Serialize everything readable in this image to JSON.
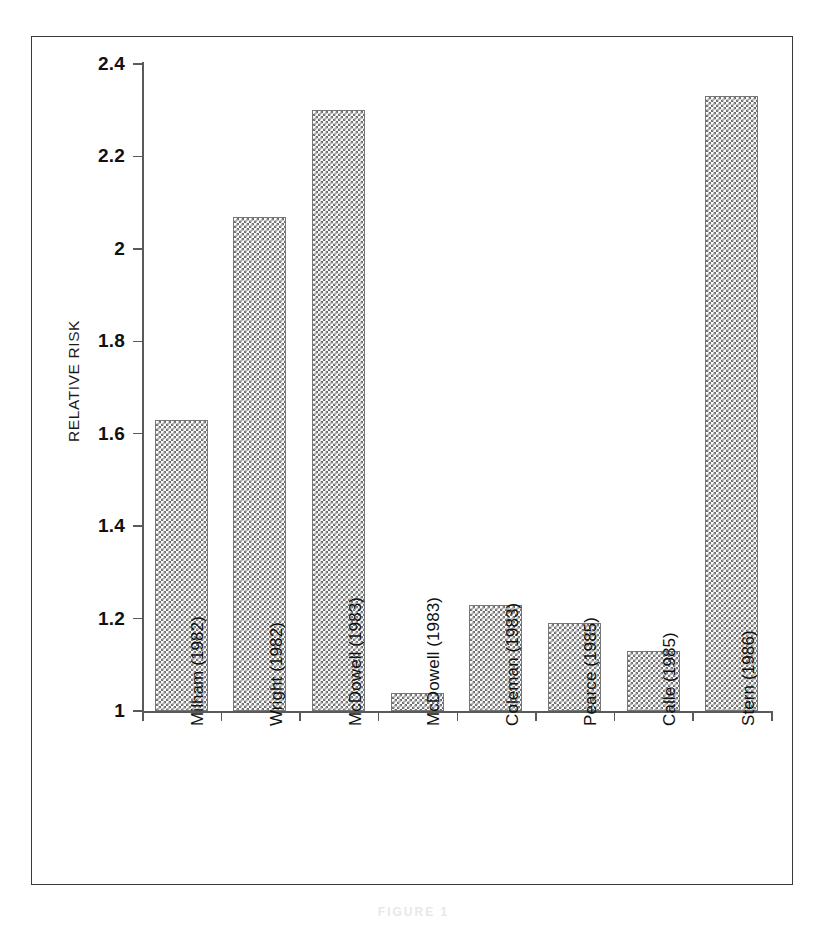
{
  "figure": {
    "caption": "FIGURE 1"
  },
  "chart_data": {
    "type": "bar",
    "title": "",
    "xlabel": "",
    "ylabel": "RELATIVE RISK",
    "ylim": [
      1,
      2.4
    ],
    "yticks": [
      "1",
      "1.2",
      "1.4",
      "1.6",
      "1.8",
      "2",
      "2.2",
      "2.4"
    ],
    "ytick_values": [
      1,
      1.2,
      1.4,
      1.6,
      1.8,
      2,
      2.2,
      2.4
    ],
    "grid": false,
    "legend": null,
    "categories": [
      "Milham (1982)",
      "Wright (1982)",
      "McDowell (1983)",
      "McDowell (1983)",
      "Coleman (1983)",
      "Pearce (1985)",
      "Calle (1985)",
      "Stern (1986)"
    ],
    "values": [
      1.63,
      2.07,
      2.3,
      1.04,
      1.23,
      1.19,
      1.13,
      2.33
    ],
    "bar_fill": "#6f6f6f",
    "bar_edge": "#777777",
    "axis_color": "#5a5a5a"
  }
}
